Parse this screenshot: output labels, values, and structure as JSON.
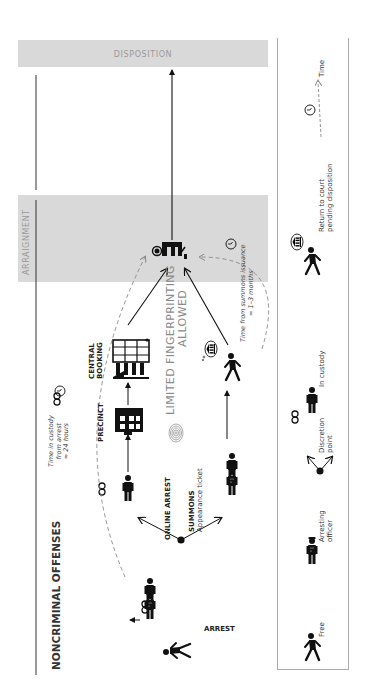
{
  "title": "NONCRIMINAL OFFENSES",
  "stages": {
    "arraignment": "ARRAIGNMENT",
    "disposition": "DISPOSITION"
  },
  "nodes": {
    "arrest": "ARREST",
    "online_arrest": "ONLINE ARREST",
    "summons": "SUMMONS",
    "summons_sub": "Appearance ticket",
    "precinct": "PRECINCT",
    "central_booking_1": "CENTRAL",
    "central_booking_2": "BOOKING",
    "fingerprinting_1": "LIMITED FINGERPRINTING",
    "fingerprinting_2": "ALLOWED"
  },
  "annotations": {
    "custody_time_1": "Time in custody",
    "custody_time_2": "from arrest",
    "custody_time_3": "≈ 24 hours",
    "summons_time_1": "Time from summons issuance",
    "summons_time_2": "= 1–3 months"
  },
  "legend": {
    "items": [
      {
        "icon": "free-person-icon",
        "label_1": "Free",
        "label_2": ""
      },
      {
        "icon": "arresting-officer-icon",
        "label_1": "Arresting",
        "label_2": "officer"
      },
      {
        "icon": "discretion-point-icon",
        "label_1": "Discretion",
        "label_2": "point"
      },
      {
        "icon": "in-custody-icon",
        "label_1": "In custody",
        "label_2": ""
      },
      {
        "icon": "return-to-court-icon",
        "label_1": "Return to court",
        "label_2": "pending disposition"
      },
      {
        "icon": "clock-icon",
        "label_1": "Time",
        "label_2": ""
      }
    ]
  },
  "colors": {
    "band": "#d9d9d9",
    "ink": "#111111",
    "band_text": "#9a9a9a",
    "dashed": "#888888"
  }
}
